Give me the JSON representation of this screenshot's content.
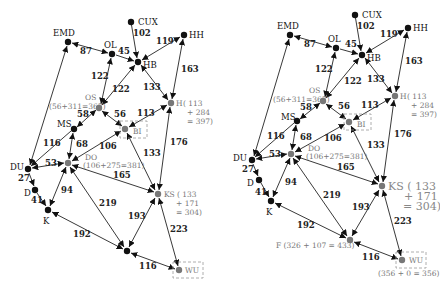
{
  "diagrams": [
    {
      "name": "left-graph",
      "nodes": [
        {
          "id": "CUX",
          "label": "CUX",
          "x": 131,
          "y": 22,
          "gray": false
        },
        {
          "id": "EMD",
          "label": "EMD",
          "x": 68,
          "y": 42,
          "gray": false
        },
        {
          "id": "OL",
          "label": "OL",
          "x": 112,
          "y": 54,
          "gray": false
        },
        {
          "id": "HB",
          "label": "HB",
          "x": 138,
          "y": 62,
          "gray": false
        },
        {
          "id": "HH",
          "label": "HH",
          "x": 184,
          "y": 35,
          "gray": false
        },
        {
          "id": "OS",
          "label": "OS",
          "x": 99,
          "y": 108,
          "gray": true,
          "extra": "(56+311=367)"
        },
        {
          "id": "H",
          "label": "H",
          "x": 171,
          "y": 103,
          "gray": true,
          "extra": "( 113 + 284 = 397)"
        },
        {
          "id": "MS",
          "label": "MS",
          "x": 74,
          "y": 129,
          "gray": false
        },
        {
          "id": "BI",
          "label": "BI",
          "x": 125,
          "y": 129,
          "gray": true
        },
        {
          "id": "DO",
          "label": "DO",
          "x": 68,
          "y": 163,
          "gray": true,
          "extra": "(106+275=381)"
        },
        {
          "id": "DU",
          "label": "DU",
          "x": 28,
          "y": 169,
          "gray": false
        },
        {
          "id": "D",
          "label": "D",
          "x": 35,
          "y": 190,
          "gray": false
        },
        {
          "id": "K",
          "label": "K",
          "x": 48,
          "y": 210,
          "gray": false
        },
        {
          "id": "KS",
          "label": "KS",
          "x": 158,
          "y": 194,
          "gray": true,
          "extra": "( 133 + 171 = 304)"
        },
        {
          "id": "F",
          "label": "",
          "x": 127,
          "y": 251,
          "gray": false
        },
        {
          "id": "WU",
          "label": "WU",
          "x": 179,
          "y": 270,
          "gray": true
        }
      ]
    },
    {
      "name": "right-graph",
      "nodes": [
        {
          "id": "CUX",
          "label": "CUX",
          "x": 355,
          "y": 15
        },
        {
          "id": "EMD",
          "label": "EMD",
          "x": 290,
          "y": 35
        },
        {
          "id": "OL",
          "label": "OL",
          "x": 336,
          "y": 48
        },
        {
          "id": "HB",
          "label": "HB",
          "x": 362,
          "y": 55
        },
        {
          "id": "HH",
          "label": "HH",
          "x": 408,
          "y": 28
        },
        {
          "id": "OS",
          "label": "OS",
          "x": 323,
          "y": 101,
          "extra": "(56+311=367)"
        },
        {
          "id": "H",
          "label": "H",
          "x": 395,
          "y": 96,
          "extra": "( 113 + 284 = 397)"
        },
        {
          "id": "MS",
          "label": "MS",
          "x": 297,
          "y": 121
        },
        {
          "id": "BI",
          "label": "BI",
          "x": 349,
          "y": 122
        },
        {
          "id": "DO",
          "label": "DO",
          "x": 291,
          "y": 154,
          "extra": "(106+275=381)"
        },
        {
          "id": "DU",
          "label": "DU",
          "x": 252,
          "y": 160
        },
        {
          "id": "D",
          "label": "D",
          "x": 259,
          "y": 180
        },
        {
          "id": "K",
          "label": "K",
          "x": 271,
          "y": 201
        },
        {
          "id": "KS",
          "label": "KS",
          "x": 382,
          "y": 186,
          "extra": "( 133 + 171 = 304)"
        },
        {
          "id": "F",
          "label": "F",
          "x": 350,
          "y": 240,
          "extra": "(326 + 107 = 433)"
        },
        {
          "id": "WU",
          "label": "WU",
          "x": 402,
          "y": 260,
          "extra": "(356 + 0 = 356)"
        }
      ]
    }
  ],
  "edges": [
    {
      "from": "CUX",
      "to": "HB",
      "weight": "102"
    },
    {
      "from": "EMD",
      "to": "OL",
      "weight": "87"
    },
    {
      "from": "OL",
      "to": "HB",
      "weight": "45"
    },
    {
      "from": "HH",
      "to": "HB",
      "weight": "119"
    },
    {
      "from": "OL",
      "to": "OS",
      "weight": "122"
    },
    {
      "from": "HB",
      "to": "OS",
      "weight": "122"
    },
    {
      "from": "HB",
      "to": "H",
      "weight": "133"
    },
    {
      "from": "HH",
      "to": "H",
      "weight": "163"
    },
    {
      "from": "OS",
      "to": "MS",
      "weight": "58"
    },
    {
      "from": "OS",
      "to": "BI",
      "weight": "56"
    },
    {
      "from": "BI",
      "to": "H",
      "weight": "113"
    },
    {
      "from": "EMD",
      "to": "DU",
      "weight": "116"
    },
    {
      "from": "MS",
      "to": "DO",
      "weight": "68"
    },
    {
      "from": "DO",
      "to": "BI",
      "weight": "106"
    },
    {
      "from": "BI",
      "to": "KS",
      "weight": "133"
    },
    {
      "from": "KS",
      "to": "H",
      "weight": "176"
    },
    {
      "from": "DU",
      "to": "DO",
      "weight": "53"
    },
    {
      "from": "DU",
      "to": "D",
      "weight": "27"
    },
    {
      "from": "D",
      "to": "K",
      "weight": "41"
    },
    {
      "from": "DO",
      "to": "K",
      "weight": "94"
    },
    {
      "from": "DO",
      "to": "KS",
      "weight": "165"
    },
    {
      "from": "DO",
      "to": "F",
      "weight": "219"
    },
    {
      "from": "KS",
      "to": "F",
      "weight": "193"
    },
    {
      "from": "KS",
      "to": "WU",
      "weight": "223"
    },
    {
      "from": "K",
      "to": "F",
      "weight": "192"
    },
    {
      "from": "F",
      "to": "WU",
      "weight": "116"
    },
    {
      "from": "MS",
      "to": "DU",
      "weight": "116"
    }
  ],
  "labels": {
    "left": {
      "CUX": "CUX",
      "EMD": "EMD",
      "OL": "OL",
      "HB": "HB",
      "HH": "HH",
      "OS": "OS",
      "OS_extra": "(56+311=367)",
      "H": "H",
      "H_l1": "( 113",
      "H_l2": "+ 284",
      "H_l3": "= 397)",
      "MS": "MS",
      "BI": "BI",
      "DO": "DO",
      "DO_extra": "(106+275=381)",
      "DU": "DU",
      "D": "D",
      "K": "K",
      "KS": "KS",
      "KS_l1": "( 133",
      "KS_l2": "+ 171",
      "KS_l3": "= 304)",
      "WU": "WU"
    },
    "right": {
      "CUX": "CUX",
      "EMD": "EMD",
      "OL": "OL",
      "HB": "HB",
      "HH": "HH",
      "OS": "OS",
      "OS_extra": "(56+311=367)",
      "H": "H",
      "H_l1": "( 113",
      "H_l2": "+ 284",
      "H_l3": "= 397)",
      "MS": "MS",
      "BI": "BI",
      "DO": "DO",
      "DO_extra": "(106+275=381)",
      "DU": "DU",
      "D": "D",
      "K": "K",
      "KS": "KS ( 133",
      "KS_l2": "+ 171",
      "KS_l3": "= 304)",
      "F": "F (326 + 107 = 433)",
      "WU": "WU",
      "WU_extra": "(356 + 0 = 356)"
    }
  },
  "weights": {
    "w102": "102",
    "w87": "87",
    "w45": "45",
    "w119": "119",
    "w122a": "122",
    "w122b": "122",
    "w133a": "133",
    "w163": "163",
    "w58": "58",
    "w56": "56",
    "w113": "113",
    "w116a": "116",
    "w68": "68",
    "w106": "106",
    "w133b": "133",
    "w176": "176",
    "w53": "53",
    "w27": "27",
    "w41": "41",
    "w94": "94",
    "w165": "165",
    "w219": "219",
    "w193": "193",
    "w223": "223",
    "w192": "192",
    "w116b": "116"
  }
}
